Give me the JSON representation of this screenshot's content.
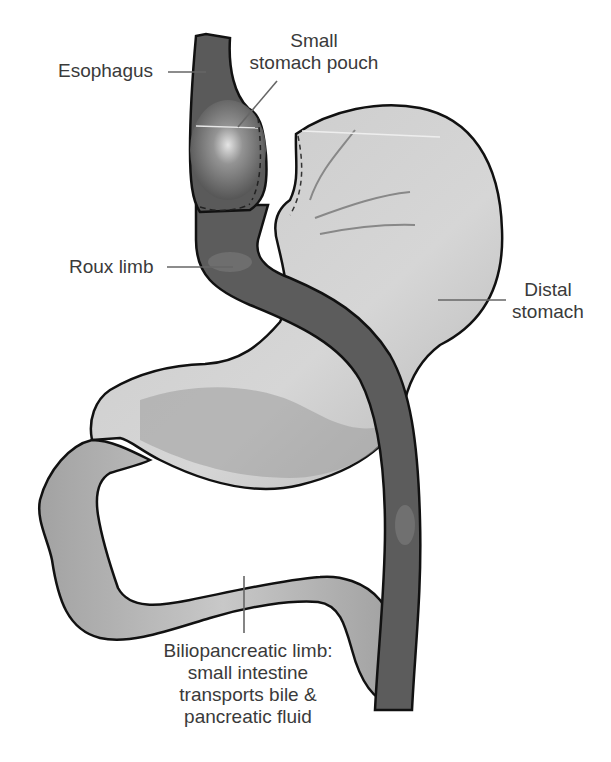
{
  "figure": {
    "colors": {
      "background": "#ffffff",
      "roux_limb": "#5c5c5c",
      "esophagus": "#5a5a5a",
      "pouch_highlight": "#d8d8d8",
      "distal_stomach": "#c4c4c4",
      "distal_stomach_shade": "#9c9c9c",
      "biliopancreatic_limb": "#a8a8a8",
      "outline": "#111111",
      "leader_line": "#666666",
      "label_text": "#3a3a3a"
    }
  },
  "labels": {
    "esophagus": "Esophagus",
    "pouch": {
      "line1": "Small",
      "line2": "stomach pouch"
    },
    "roux_limb": "Roux limb",
    "distal_stomach": {
      "line1": "Distal",
      "line2": "stomach"
    },
    "biliopancreatic": {
      "line1": "Biliopancreatic limb:",
      "line2": "small intestine",
      "line3": "transports bile &",
      "line4": "pancreatic fluid"
    }
  }
}
